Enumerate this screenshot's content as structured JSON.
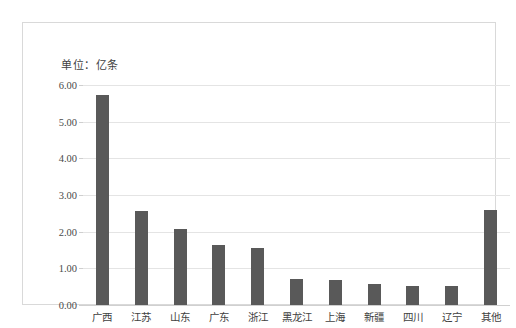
{
  "frame": {
    "border_color": "#d9d9d9",
    "background": "#ffffff"
  },
  "unit_note": "单位：亿条",
  "chart_data": {
    "type": "bar",
    "title": "",
    "subtitle": "",
    "xlabel": "",
    "ylabel": "",
    "unit_label": "单位：亿条",
    "categories": [
      "广西",
      "江苏",
      "山东",
      "广东",
      "浙江",
      "黑龙江",
      "上海",
      "新疆",
      "四川",
      "辽宁",
      "其他"
    ],
    "values": [
      5.73,
      2.56,
      2.08,
      1.63,
      1.56,
      0.7,
      0.67,
      0.56,
      0.53,
      0.52,
      2.58
    ],
    "ylim": [
      0.0,
      6.0
    ],
    "ytick_step": 1.0,
    "ytick_labels": [
      "6.00",
      "5.00",
      "4.00",
      "3.00",
      "2.00",
      "1.00",
      "0.00"
    ],
    "ytick_values": [
      6.0,
      5.0,
      4.0,
      3.0,
      2.0,
      1.0,
      0.0
    ],
    "grid": true,
    "legend": false,
    "legend_position": "none",
    "bar_color": "#595959",
    "gridline_color": "#e4e4e4",
    "axis_color": "#d0d0d0"
  }
}
